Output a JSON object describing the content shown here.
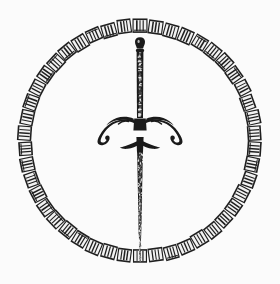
{
  "image": {
    "title": "Sword within a beaded circular band",
    "subject": "sword-in-circle-emblem",
    "style": "monochrome engraving / line art",
    "background_color": "#fefefe",
    "ink_color": "#1a1a1a",
    "canvas": {
      "width": 280,
      "height": 284
    }
  },
  "circle": {
    "name": "segmented-ring",
    "center_x": 140,
    "center_y": 141,
    "outer_radius": 122,
    "inner_radius": 108,
    "band_width": 14,
    "segment_count": 46,
    "segment_fill": "#1f1f1f",
    "segment_inner_fill": "#f2f2f2",
    "stripes_per_segment": 3,
    "description": "A ring drawn as a chain of small rectangular blocks, each block outlined in dark ink and filled with short pale vertical strokes, giving a beaded or key-pattern torc appearance."
  },
  "sword": {
    "name": "vertical-sword",
    "orientation": "point-down",
    "axis_x": 140,
    "top_y": 38,
    "tip_y": 262,
    "color": "#1a1a1a",
    "pommel": {
      "name": "pommel",
      "center_y": 44,
      "width": 9,
      "height": 12,
      "shape": "small rounded knob"
    },
    "grip": {
      "name": "grip",
      "top_y": 52,
      "bottom_y": 116,
      "width": 7,
      "texture": "mottled / wire-wrapped"
    },
    "crossguard": {
      "name": "crossguard",
      "center_y": 124,
      "span_left_x": 98,
      "span_right_x": 182,
      "span_width": 84,
      "shape": "two quillons sweeping downward and outward, ending in curled hooks",
      "quillon_count": 2
    },
    "secondary_guard": {
      "name": "lower-guard",
      "center_y": 148,
      "span_left_x": 120,
      "span_right_x": 160,
      "span_width": 40,
      "shape": "small swept bar below the main guard"
    },
    "blade": {
      "name": "blade",
      "top_y": 152,
      "tip_y": 262,
      "width_top": 6,
      "width_tip": 2,
      "texture": "speckled, tapering to a point that touches the bottom of the ring"
    }
  },
  "composition": {
    "notes": "Sword is centered vertically; the blade tip meets the lower inner edge of the ring and the pommel sits just below the upper inner edge.",
    "symmetry": "bilateral about the vertical axis"
  }
}
